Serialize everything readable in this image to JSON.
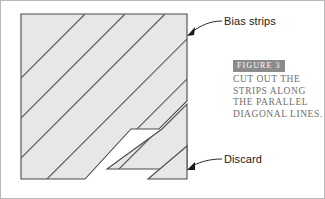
{
  "figure": {
    "callouts": [
      {
        "id": "bias-strips",
        "label": "Bias strips"
      },
      {
        "id": "discard",
        "label": "Discard"
      }
    ],
    "caption": {
      "badge": "FIGURE 3",
      "lines": [
        "CUT OUT THE",
        "STRIPS ALONG",
        "THE PARALLEL",
        "DIAGONAL LINES."
      ]
    },
    "colors": {
      "fabric_fill": "#e9e9e9",
      "outline": "#4a4a4a",
      "hatch_line": "#5a5a5a",
      "badge_background": "#8b8b8b",
      "badge_text": "#ffffff",
      "caption_text": "#6f6f6f",
      "label_text": "#1a1a1a",
      "leader_line": "#2b2b2b",
      "frame_border": "#b9b9b9"
    },
    "shapes": {
      "main_square": {
        "name": "fabric-square",
        "points": "20,13 186,13 186,100 158,128 130,128 84,178 20,178"
      },
      "strip_piece": {
        "name": "cut-strip",
        "points": "161,128 186,103 186,168 106,168"
      },
      "discard_triangle": {
        "name": "discard-triangle",
        "points": "186,145 186,178 147,178"
      },
      "diagonals": [
        "20,77 84,13",
        "20,117 124,13",
        "20,157 164,13",
        "33,178 186,25",
        "73,178 186,65",
        "113,170 186,97",
        "139,168 186,121"
      ]
    },
    "leaders": [
      {
        "name": "bias-strips-leader",
        "path": "M 220,21 C 210,21 203,25 195,28",
        "arrow": "186,33 193,26 195,33"
      },
      {
        "name": "discard-leader",
        "path": "M 220,159 C 210,159 203,162 195,164",
        "arrow": "186,169 193,162 195,169"
      }
    ]
  }
}
